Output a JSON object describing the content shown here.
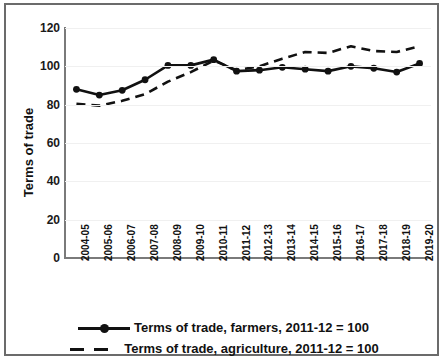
{
  "chart_data": {
    "type": "line",
    "title": "",
    "xlabel": "",
    "ylabel": "Terms of trade",
    "ylim": [
      0,
      120
    ],
    "yticks": [
      0,
      20,
      40,
      60,
      80,
      100,
      120
    ],
    "grid": true,
    "legend_position": "bottom",
    "categories": [
      "2004-05",
      "2005-06",
      "2006-07",
      "2007-08",
      "2008-09",
      "2009-10",
      "2010-11",
      "2011-12",
      "2012-13",
      "2013-14",
      "2014-15",
      "2015-16",
      "2016-17",
      "2017-18",
      "2018-19",
      "2019-20"
    ],
    "series": [
      {
        "name": "Terms of trade, farmers, 2011-12 = 100",
        "style": "solid-with-markers",
        "color": "#111111",
        "values": [
          88,
          85,
          87.5,
          93,
          100.5,
          100.5,
          103.5,
          97.5,
          98,
          99.5,
          98.5,
          97.5,
          100,
          99,
          97,
          101.5
        ]
      },
      {
        "name": "Terms of trade, agriculture, 2011-12 = 100",
        "style": "dashed",
        "color": "#111111",
        "values": [
          80.5,
          79.5,
          82,
          85.5,
          92,
          97,
          103,
          98,
          100,
          104,
          107.5,
          107,
          110.5,
          108,
          107.5,
          110.5
        ]
      }
    ]
  },
  "axis": {
    "y_label": "Terms of trade",
    "y_tick_labels": [
      "120",
      "100",
      "80",
      "60",
      "40",
      "20",
      "0"
    ],
    "x_tick_labels": [
      "2004-05",
      "2005-06",
      "2006-07",
      "2007-08",
      "2008-09",
      "2009-10",
      "2010-11",
      "2011-12",
      "2012-13",
      "2013-14",
      "2014-15",
      "2015-16",
      "2016-17",
      "2017-18",
      "2018-19",
      "2019-20"
    ]
  },
  "legend": {
    "items": [
      {
        "label": "Terms of trade, farmers, 2011-12 = 100",
        "marker": "line-marker-icon"
      },
      {
        "label": "Terms of trade, agriculture, 2011-12 = 100",
        "marker": "dashed-line-icon"
      }
    ]
  }
}
